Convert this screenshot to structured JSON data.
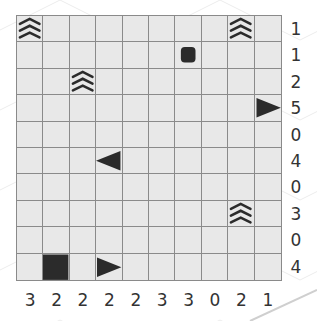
{
  "puzzle": {
    "rows": 10,
    "cols": 10,
    "row_clues": [
      "1",
      "1",
      "2",
      "5",
      "0",
      "4",
      "0",
      "3",
      "0",
      "4"
    ],
    "col_clues": [
      "3",
      "2",
      "2",
      "2",
      "2",
      "3",
      "3",
      "0",
      "2",
      "1"
    ],
    "given_cells": [
      {
        "row": 0,
        "col": 0,
        "type": "water"
      },
      {
        "row": 0,
        "col": 8,
        "type": "water"
      },
      {
        "row": 1,
        "col": 6,
        "type": "circle"
      },
      {
        "row": 2,
        "col": 2,
        "type": "water"
      },
      {
        "row": 3,
        "col": 9,
        "type": "end-right"
      },
      {
        "row": 5,
        "col": 3,
        "type": "end-left"
      },
      {
        "row": 7,
        "col": 8,
        "type": "water"
      },
      {
        "row": 9,
        "col": 1,
        "type": "square"
      },
      {
        "row": 9,
        "col": 3,
        "type": "end-right"
      }
    ],
    "colors": {
      "cell_bg": "#e8e8e8",
      "grid_line": "#8a8a8a",
      "ship": "#2b2b2b",
      "clue_text": "#333333"
    }
  }
}
